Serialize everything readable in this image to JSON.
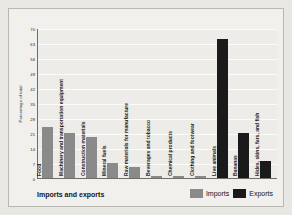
{
  "caption": "Imports and exports",
  "legend": {
    "items": [
      {
        "label": "Imports",
        "color": "#8a8a8a"
      },
      {
        "label": "Exports",
        "color": "#1a1a1a"
      }
    ]
  },
  "chart_data": {
    "type": "bar",
    "title": "Imports and exports",
    "xlabel": "",
    "ylabel": "Percentage of total",
    "ylim": [
      0,
      70
    ],
    "yticks": [
      70,
      63,
      56,
      49,
      42,
      35,
      28,
      21,
      14,
      7,
      0
    ],
    "grid": true,
    "legend_position": "bottom-right",
    "categories": [
      "Food",
      "Machinery and transportation equipment",
      "Construction materials",
      "Mineral fuels",
      "Raw materials for manufacture",
      "Beverages and tobacco",
      "Chemical products",
      "Clothing and footwear",
      "Live animals",
      "Bananas",
      "Hides, skins, furs, and fish"
    ],
    "series": [
      {
        "name": "Imports",
        "color": "#8a8a8a",
        "values": [
          24,
          21,
          19,
          7,
          5,
          1,
          1,
          1,
          0,
          0,
          0
        ]
      },
      {
        "name": "Exports",
        "color": "#1a1a1a",
        "values": [
          0,
          0,
          0,
          0,
          0,
          0,
          0,
          0,
          65,
          21,
          8
        ]
      }
    ]
  }
}
